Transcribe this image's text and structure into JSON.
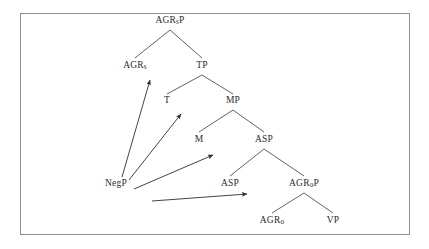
{
  "figure": {
    "type": "syntactic-tree-diagram",
    "background_color": "#ffffff",
    "frame_color": "#8e8e8e",
    "line_color": "#3a3a3a",
    "text_color": "#2b2b2b"
  },
  "nodes": [
    {
      "id": "agrsp",
      "label": "AGRsP",
      "base": "AGR",
      "sub": "s",
      "tail": "P",
      "x": 170,
      "y": 21
    },
    {
      "id": "agrs",
      "label": "AGRs",
      "base": "AGR",
      "sub": "s",
      "tail": "",
      "x": 135,
      "y": 66
    },
    {
      "id": "tp",
      "label": "TP",
      "base": "TP",
      "sub": "",
      "tail": "",
      "x": 202,
      "y": 66
    },
    {
      "id": "t",
      "label": "T",
      "base": "T",
      "sub": "",
      "tail": "",
      "x": 167,
      "y": 101
    },
    {
      "id": "mp",
      "label": "MP",
      "base": "MP",
      "sub": "",
      "tail": "",
      "x": 233,
      "y": 101
    },
    {
      "id": "m",
      "label": "M",
      "base": "M",
      "sub": "",
      "tail": "",
      "x": 199,
      "y": 140
    },
    {
      "id": "asp1",
      "label": "ASP",
      "base": "ASP",
      "sub": "",
      "tail": "",
      "x": 264,
      "y": 140
    },
    {
      "id": "negp",
      "label": "NegP",
      "base": "NegP",
      "sub": "",
      "tail": "",
      "x": 116,
      "y": 184
    },
    {
      "id": "asp2",
      "label": "ASP",
      "base": "ASP",
      "sub": "",
      "tail": "",
      "x": 230,
      "y": 184
    },
    {
      "id": "agrop",
      "label": "AGRoP",
      "base": "AGR",
      "sub": "o",
      "tail": "P",
      "x": 304,
      "y": 184
    },
    {
      "id": "agro",
      "label": "AGRo",
      "base": "AGR",
      "sub": "o",
      "tail": "",
      "x": 272,
      "y": 221
    },
    {
      "id": "vp",
      "label": "VP",
      "base": "VP",
      "sub": "",
      "tail": "",
      "x": 333,
      "y": 221
    }
  ],
  "branches": [
    {
      "from": "agrsp",
      "to": "agrs",
      "x1": 170,
      "y1": 30,
      "x2": 135,
      "y2": 58
    },
    {
      "from": "agrsp",
      "to": "tp",
      "x1": 170,
      "y1": 30,
      "x2": 202,
      "y2": 58
    },
    {
      "from": "tp",
      "to": "t",
      "x1": 202,
      "y1": 75,
      "x2": 167,
      "y2": 94
    },
    {
      "from": "tp",
      "to": "mp",
      "x1": 202,
      "y1": 75,
      "x2": 233,
      "y2": 94
    },
    {
      "from": "mp",
      "to": "m",
      "x1": 233,
      "y1": 110,
      "x2": 199,
      "y2": 132
    },
    {
      "from": "mp",
      "to": "asp1",
      "x1": 233,
      "y1": 110,
      "x2": 264,
      "y2": 132
    },
    {
      "from": "asp1",
      "to": "asp2",
      "x1": 264,
      "y1": 149,
      "x2": 230,
      "y2": 176
    },
    {
      "from": "asp1",
      "to": "agrop",
      "x1": 264,
      "y1": 149,
      "x2": 304,
      "y2": 176
    },
    {
      "from": "agrop",
      "to": "agro",
      "x1": 304,
      "y1": 193,
      "x2": 272,
      "y2": 213
    },
    {
      "from": "agrop",
      "to": "vp",
      "x1": 304,
      "y1": 193,
      "x2": 333,
      "y2": 213
    }
  ],
  "movement_arrows": [
    {
      "id": "arrow-to-agrs",
      "from_label": "NegP",
      "to_label": "AGRs",
      "x1": 122,
      "y1": 177,
      "x2": 150,
      "y2": 80
    },
    {
      "id": "arrow-to-t",
      "from_label": "NegP",
      "to_label": "T",
      "x1": 129,
      "y1": 180,
      "x2": 181,
      "y2": 114
    },
    {
      "id": "arrow-to-m",
      "from_label": "NegP",
      "to_label": "M",
      "x1": 134,
      "y1": 189,
      "x2": 213,
      "y2": 155
    },
    {
      "id": "arrow-to-asp",
      "from_label": "NegP",
      "to_label": "ASP",
      "x1": 152,
      "y1": 201,
      "x2": 247,
      "y2": 194
    }
  ]
}
